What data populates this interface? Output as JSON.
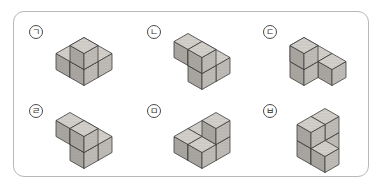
{
  "worksheet": {
    "title": "Cube arrangement figures",
    "background_color": "#ffffff",
    "border_color": "#b8b8b8",
    "cube_top_color": "#d5d2cd",
    "cube_left_color": "#a9a6a1",
    "cube_right_color": "#c0bdb8",
    "cube_edge_color": "#3a3a3a"
  },
  "figures": [
    {
      "label": "ㄱ",
      "name": "figure-g",
      "cube_count": 5,
      "description": "Four cubes forming an L / T shaped base layer with one cube stacked on the back corner",
      "cells": [
        {
          "x": 0,
          "y": 0,
          "z": 0
        },
        {
          "x": 1,
          "y": 0,
          "z": 0
        },
        {
          "x": 1,
          "y": 1,
          "z": 0
        },
        {
          "x": 0,
          "y": 1,
          "z": 0
        },
        {
          "x": 1,
          "y": 1,
          "z": 1
        }
      ]
    },
    {
      "label": "ㄴ",
      "name": "figure-n",
      "cube_count": 5,
      "description": "Two cubes on the upper back row with three cubes stepping down to the front",
      "cells": [
        {
          "x": 0,
          "y": 0,
          "z": 0
        },
        {
          "x": 1,
          "y": 0,
          "z": 0
        },
        {
          "x": 1,
          "y": 1,
          "z": 0
        },
        {
          "x": 0,
          "y": 1,
          "z": 1
        },
        {
          "x": 1,
          "y": 1,
          "z": 1
        }
      ]
    },
    {
      "label": "ㄷ",
      "name": "figure-d",
      "cube_count": 5,
      "description": "Plus / cross shaped arrangement with one cube raised at the back",
      "cells": [
        {
          "x": 0,
          "y": 0,
          "z": 0
        },
        {
          "x": 1,
          "y": 0,
          "z": 0
        },
        {
          "x": 2,
          "y": 0,
          "z": 0
        },
        {
          "x": 1,
          "y": 1,
          "z": 0
        },
        {
          "x": 1,
          "y": 1,
          "z": 1
        }
      ]
    },
    {
      "label": "ㄹ",
      "name": "figure-r",
      "cube_count": 5,
      "description": "Stepped block: two by two upper group with a cube projecting to the lower left",
      "cells": [
        {
          "x": 0,
          "y": 0,
          "z": 0
        },
        {
          "x": 1,
          "y": 0,
          "z": 0
        },
        {
          "x": 1,
          "y": 1,
          "z": 0
        },
        {
          "x": 0,
          "y": 1,
          "z": 1
        },
        {
          "x": 1,
          "y": 1,
          "z": 1
        }
      ]
    },
    {
      "label": "ㅁ",
      "name": "figure-m",
      "cube_count": 5,
      "description": "Flat L shaped layer of four cubes with one cube raised on the right",
      "cells": [
        {
          "x": 0,
          "y": 0,
          "z": 0
        },
        {
          "x": 1,
          "y": 0,
          "z": 0
        },
        {
          "x": 0,
          "y": 1,
          "z": 0
        },
        {
          "x": 1,
          "y": 1,
          "z": 0
        },
        {
          "x": 1,
          "y": 0,
          "z": 1
        }
      ]
    },
    {
      "label": "ㅂ",
      "name": "figure-b",
      "cube_count": 5,
      "description": "Two by two tower with a single cube attached on the lower right",
      "cells": [
        {
          "x": 0,
          "y": 0,
          "z": 0
        },
        {
          "x": 0,
          "y": 1,
          "z": 0
        },
        {
          "x": 1,
          "y": 1,
          "z": 0
        },
        {
          "x": 0,
          "y": 0,
          "z": 1
        },
        {
          "x": 0,
          "y": 1,
          "z": 1
        }
      ]
    }
  ]
}
